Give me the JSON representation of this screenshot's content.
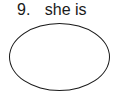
{
  "question": {
    "number": "9.",
    "text": "she is"
  },
  "answer_shape": "oval"
}
